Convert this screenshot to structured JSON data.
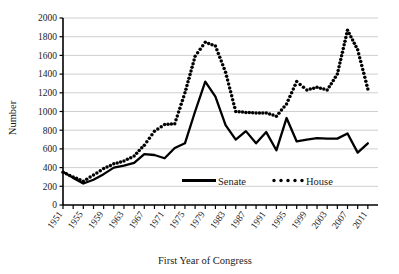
{
  "chart_data": {
    "type": "line",
    "title": "",
    "xlabel": "First Year of Congress",
    "ylabel": "Number",
    "xlim": [
      1951,
      2013
    ],
    "ylim": [
      0,
      2000
    ],
    "ytick_step": 200,
    "grid": "horizontal",
    "legend_position": "inside-bottom-center",
    "x": [
      1951,
      1953,
      1955,
      1957,
      1959,
      1961,
      1963,
      1965,
      1967,
      1969,
      1971,
      1973,
      1975,
      1977,
      1979,
      1981,
      1983,
      1985,
      1987,
      1989,
      1991,
      1993,
      1995,
      1997,
      1999,
      2001,
      2003,
      2005,
      2007,
      2009,
      2011
    ],
    "xtick_labels": [
      "1951",
      "1955",
      "1959",
      "1963",
      "1967",
      "1971",
      "1975",
      "1979",
      "1983",
      "1987",
      "1991",
      "1995",
      "1999",
      "2003",
      "2007",
      "2011"
    ],
    "ytick_labels": [
      "0",
      "200",
      "400",
      "600",
      "800",
      "1000",
      "1200",
      "1400",
      "1600",
      "1800",
      "2000"
    ],
    "series": [
      {
        "name": "Senate",
        "style": "solid",
        "color": "#000000",
        "values": [
          355,
          290,
          230,
          270,
          330,
          400,
          420,
          450,
          545,
          535,
          500,
          610,
          660,
          1000,
          1320,
          1160,
          855,
          700,
          790,
          660,
          780,
          585,
          930,
          680,
          700,
          715,
          710,
          710,
          765,
          560,
          660
        ]
      },
      {
        "name": "House",
        "style": "dotted",
        "color": "#000000",
        "values": [
          350,
          300,
          255,
          320,
          390,
          440,
          470,
          525,
          640,
          790,
          860,
          870,
          1200,
          1590,
          1740,
          1700,
          1420,
          1000,
          990,
          985,
          985,
          950,
          1080,
          1320,
          1230,
          1260,
          1230,
          1400,
          1870,
          1660,
          1240
        ]
      }
    ]
  },
  "legend": {
    "items": [
      {
        "label": "Senate",
        "marker": "solid-line"
      },
      {
        "label": "House",
        "marker": "dotted-line"
      }
    ]
  }
}
